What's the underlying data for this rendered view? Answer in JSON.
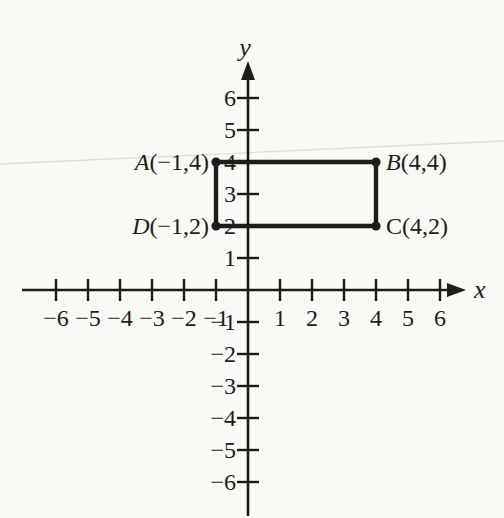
{
  "colors": {
    "ink": "#1d1d1b",
    "paper": "#f9f9f6",
    "scan_artifact": "#dededa"
  },
  "chart_data": {
    "type": "scatter",
    "title": "",
    "xlabel": "x",
    "ylabel": "y",
    "xlim": [
      -6,
      6
    ],
    "ylim": [
      -6,
      6
    ],
    "grid": false,
    "legend": "none",
    "xticks": [
      {
        "value": -6,
        "label": "−6"
      },
      {
        "value": -5,
        "label": "−5"
      },
      {
        "value": -4,
        "label": "−4"
      },
      {
        "value": -3,
        "label": "−3"
      },
      {
        "value": -2,
        "label": "−2"
      },
      {
        "value": -1,
        "label": "−1"
      },
      {
        "value": 1,
        "label": "1"
      },
      {
        "value": 2,
        "label": "2"
      },
      {
        "value": 3,
        "label": "3"
      },
      {
        "value": 4,
        "label": "4"
      },
      {
        "value": 5,
        "label": "5"
      },
      {
        "value": 6,
        "label": "6"
      }
    ],
    "yticks": [
      {
        "value": -6,
        "label": "−6"
      },
      {
        "value": -5,
        "label": "−5"
      },
      {
        "value": -4,
        "label": "−4"
      },
      {
        "value": -3,
        "label": "−3"
      },
      {
        "value": -2,
        "label": "−2"
      },
      {
        "value": -1,
        "label": "−1"
      },
      {
        "value": 1,
        "label": "1"
      },
      {
        "value": 2,
        "label": "2"
      },
      {
        "value": 3,
        "label": "3"
      },
      {
        "value": 4,
        "label": "4"
      },
      {
        "value": 5,
        "label": "5"
      },
      {
        "value": 6,
        "label": "6"
      }
    ],
    "shape": {
      "kind": "rectangle",
      "closed": true,
      "vertices": [
        {
          "name": "A",
          "x": -1,
          "y": 4,
          "coords_text": "(−1,4)",
          "label_side": "left",
          "name_italic": true
        },
        {
          "name": "B",
          "x": 4,
          "y": 4,
          "coords_text": "(4,4)",
          "label_side": "right",
          "name_italic": true
        },
        {
          "name": "C",
          "x": 4,
          "y": 2,
          "coords_text": "(4,2)",
          "label_side": "right",
          "name_italic": false
        },
        {
          "name": "D",
          "x": -1,
          "y": 2,
          "coords_text": "(−1,2)",
          "label_side": "left",
          "name_italic": true
        }
      ]
    }
  }
}
